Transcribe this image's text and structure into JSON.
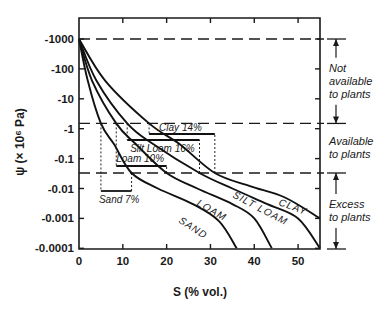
{
  "chart_data": {
    "type": "line",
    "title": "",
    "xlabel": "S (% vol.)",
    "ylabel": "ψ (× 10⁶ Pa)",
    "xlim": [
      0,
      55
    ],
    "ylim_log_abs": [
      0.0001,
      1000
    ],
    "y_scale": "log (negative values)",
    "grid": false,
    "x_ticks": [
      0,
      10,
      20,
      30,
      40,
      50
    ],
    "x_tick_labels": [
      "0",
      "10",
      "20",
      "30",
      "40",
      "50"
    ],
    "y_ticks": [
      -1000,
      -100,
      -10,
      -1,
      -0.1,
      -0.01,
      -0.001,
      -0.0001
    ],
    "y_tick_labels": [
      "-1000",
      "-100",
      "-10",
      "-1",
      "-0.1",
      "-0.01",
      "-0.001",
      "-0.0001"
    ],
    "reference_lines": [
      {
        "name": "upper limit",
        "y": -1000,
        "style": "dashed"
      },
      {
        "name": "wilting point",
        "y": -1.5,
        "style": "dashed"
      },
      {
        "name": "field capacity",
        "y": -0.033,
        "style": "dashed"
      }
    ],
    "series": [
      {
        "name": "SAND",
        "points": [
          [
            0,
            -1000
          ],
          [
            2,
            -40
          ],
          [
            5,
            -1.5
          ],
          [
            8,
            -0.3
          ],
          [
            12,
            -0.033
          ],
          [
            18,
            -0.01
          ],
          [
            26,
            -0.003
          ],
          [
            32,
            -0.0008
          ],
          [
            36,
            -0.0001
          ]
        ]
      },
      {
        "name": "LOAM",
        "points": [
          [
            0,
            -1000
          ],
          [
            3,
            -40
          ],
          [
            8.5,
            -1.5
          ],
          [
            13,
            -0.3
          ],
          [
            20,
            -0.033
          ],
          [
            27,
            -0.01
          ],
          [
            35,
            -0.003
          ],
          [
            40,
            -0.001
          ],
          [
            44,
            -0.0001
          ]
        ]
      },
      {
        "name": "SILT LOAM",
        "points": [
          [
            0,
            -1000
          ],
          [
            4,
            -40
          ],
          [
            11,
            -1.5
          ],
          [
            17,
            -0.3
          ],
          [
            27.5,
            -0.033
          ],
          [
            35,
            -0.01
          ],
          [
            43,
            -0.003
          ],
          [
            50,
            -0.001
          ],
          [
            55,
            -0.0001
          ]
        ]
      },
      {
        "name": "CLAY",
        "points": [
          [
            0,
            -1000
          ],
          [
            6,
            -40
          ],
          [
            16,
            -1.5
          ],
          [
            23,
            -0.3
          ],
          [
            31,
            -0.033
          ],
          [
            39,
            -0.012
          ],
          [
            47,
            -0.005
          ],
          [
            55,
            -0.001
          ]
        ]
      }
    ],
    "available_water_boxes": [
      {
        "label": "Sand 7%",
        "x_from": 5,
        "x_to": 12,
        "value_pct": 7
      },
      {
        "label": "Loam 10%",
        "x_from": 8.5,
        "x_to": 20,
        "value_pct": 10
      },
      {
        "label": "Silt Loam 16%",
        "x_from": 11,
        "x_to": 27.5,
        "value_pct": 16
      },
      {
        "label": "Clay 14%",
        "x_from": 16,
        "x_to": 31,
        "value_pct": 14
      }
    ],
    "annotations": [
      {
        "text": [
          "Not",
          "available",
          "to plants"
        ],
        "y_from": -1000,
        "y_to": -1.5
      },
      {
        "text": [
          "Available",
          "to plants"
        ],
        "y_from": -1.5,
        "y_to": -0.033
      },
      {
        "text": [
          "Excess",
          "to plants"
        ],
        "y_from": -0.033,
        "y_to": -0.0001
      }
    ]
  }
}
